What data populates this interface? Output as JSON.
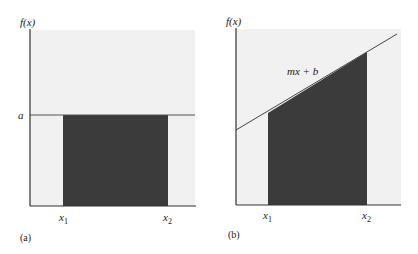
{
  "colors": {
    "plot_bg": "#f1f1f1",
    "fill": "#3b3b3b",
    "axis": "#333333",
    "line": "#444444"
  },
  "panels": [
    {
      "id": "a",
      "caption": "(a)",
      "y_axis_label": "f(x)",
      "level_label": "a",
      "x1_label": "x",
      "x1_sub": "1",
      "x2_label": "x",
      "x2_sub": "2",
      "description": "Constant function f(x)=a; shaded rectangle from x1 to x2"
    },
    {
      "id": "b",
      "caption": "(b)",
      "y_axis_label": "f(x)",
      "line_label": "mx + b",
      "x1_label": "x",
      "x1_sub": "1",
      "x2_label": "x",
      "x2_sub": "2",
      "description": "Linear function f(x)=mx+b; shaded trapezoid from x1 to x2"
    }
  ]
}
